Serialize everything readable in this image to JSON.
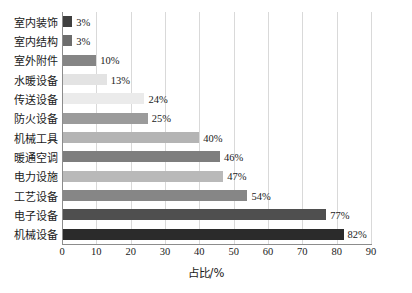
{
  "chart_data": {
    "type": "bar",
    "orientation": "horizontal",
    "title": "",
    "xlabel": "占比/%",
    "ylabel": "",
    "xlim": [
      0,
      90
    ],
    "xticks": [
      0,
      10,
      20,
      30,
      40,
      50,
      60,
      70,
      80,
      90
    ],
    "grid": "vertical",
    "legend": "none",
    "categories": [
      "室内装饰",
      "室内结构",
      "室外附件",
      "水暖设备",
      "传送设备",
      "防火设备",
      "机械工具",
      "暖通空调",
      "电力设施",
      "工艺设备",
      "电子设备",
      "机械设备"
    ],
    "values": [
      3,
      3,
      10,
      13,
      24,
      25,
      40,
      46,
      47,
      54,
      77,
      82
    ],
    "value_labels": [
      "3%",
      "3%",
      "10%",
      "13%",
      "24%",
      "25%",
      "40%",
      "46%",
      "47%",
      "54%",
      "77%",
      "82%"
    ],
    "bar_colors": [
      "#3f3f3f",
      "#6d6d6d",
      "#858585",
      "#e3e3e3",
      "#ebebeb",
      "#9b9b9b",
      "#b4b4b4",
      "#7e7e7e",
      "#b9b9b9",
      "#868686",
      "#4f4f4f",
      "#2b2b2b"
    ]
  },
  "axis": {
    "grid_color": "#d9d9d9",
    "line_color": "#8c8c8c"
  }
}
